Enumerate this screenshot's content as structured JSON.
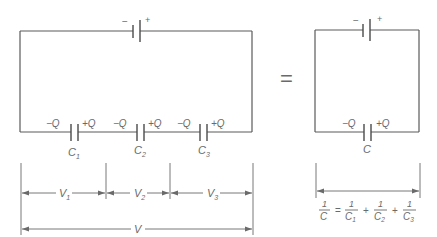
{
  "diagram": {
    "series_circuit": {
      "battery": {
        "minus_label": "−",
        "plus_label": "+"
      },
      "capacitors": [
        {
          "name": "C",
          "sub": "1",
          "left_charge": "−Q",
          "right_charge": "+Q"
        },
        {
          "name": "C",
          "sub": "2",
          "left_charge": "−Q",
          "right_charge": "+Q"
        },
        {
          "name": "C",
          "sub": "3",
          "left_charge": "−Q",
          "right_charge": "+Q"
        }
      ],
      "voltages": [
        {
          "name": "V",
          "sub": "1"
        },
        {
          "name": "V",
          "sub": "2"
        },
        {
          "name": "V",
          "sub": "3"
        }
      ],
      "total_voltage": "V"
    },
    "equals_sign": "=",
    "equivalent_circuit": {
      "battery": {
        "minus_label": "−",
        "plus_label": "+"
      },
      "capacitor": {
        "name": "C",
        "left_charge": "−Q",
        "right_charge": "+Q"
      },
      "formula": {
        "lhs_num": "1",
        "lhs_den": "C",
        "eq": "=",
        "terms": [
          {
            "num": "1",
            "den": "C",
            "sub": "1"
          },
          {
            "num": "1",
            "den": "C",
            "sub": "2"
          },
          {
            "num": "1",
            "den": "C",
            "sub": "3"
          }
        ],
        "plus": "+"
      }
    }
  }
}
